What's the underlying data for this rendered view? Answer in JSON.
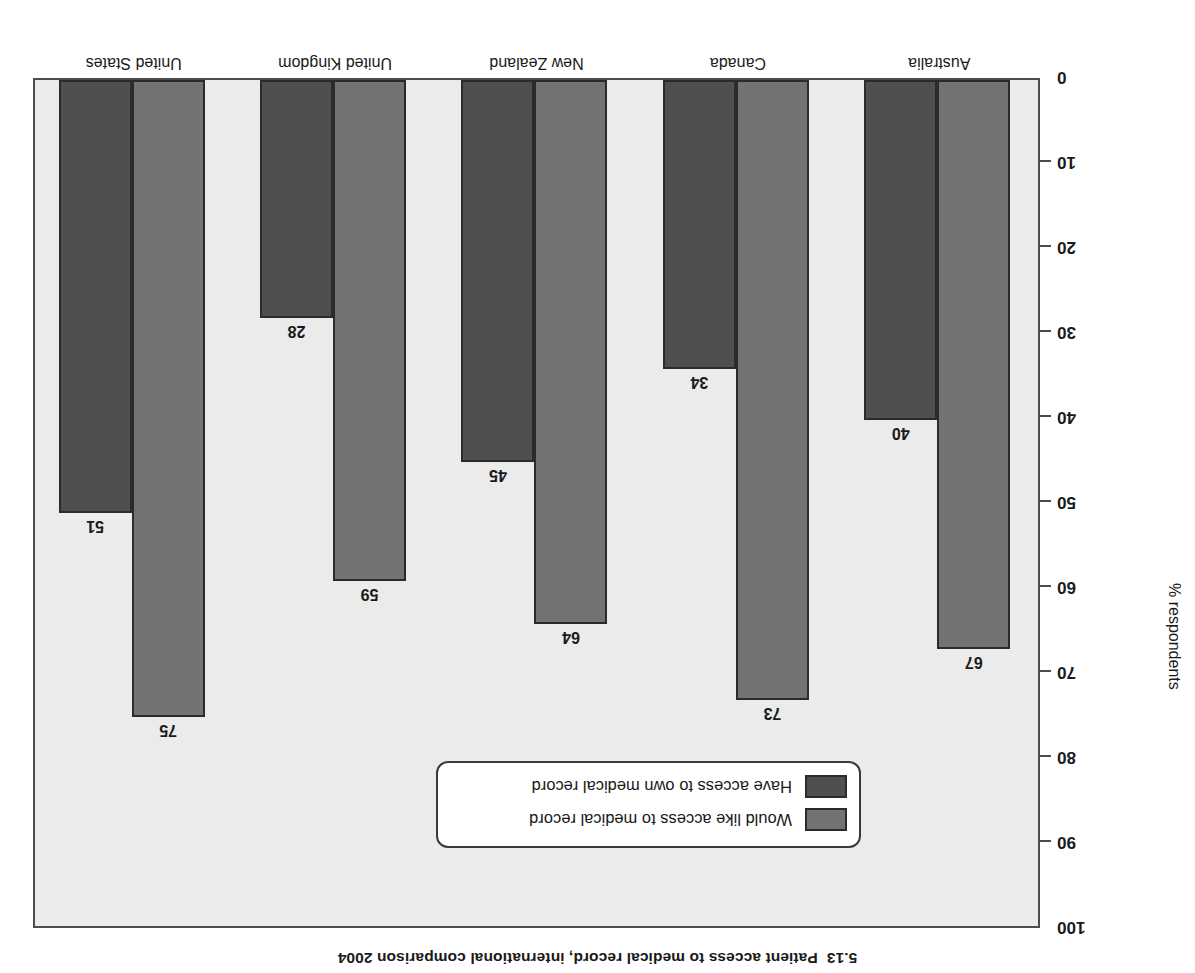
{
  "figure": {
    "number": "5.13",
    "title": "Patient access to medical record, international comparison 2004",
    "orientation_note": "rotated-180"
  },
  "chart_data": {
    "type": "bar",
    "title": "Patient access to medical record, international comparison 2004",
    "xlabel": "",
    "ylabel": "% respondents",
    "ylim": [
      0,
      100
    ],
    "yticks": [
      "0",
      "10",
      "20",
      "30",
      "40",
      "50",
      "60",
      "70",
      "80",
      "90",
      "100"
    ],
    "ytick_values": [
      0,
      10,
      20,
      30,
      40,
      50,
      60,
      70,
      80,
      90,
      100
    ],
    "grid": false,
    "legend_position": "lower-left",
    "categories": [
      "Australia",
      "Canada",
      "New Zealand",
      "United Kingdom",
      "United States"
    ],
    "series": [
      {
        "name": "Would like access to medical record",
        "color": "#737373",
        "values": [
          67,
          73,
          64,
          59,
          75
        ]
      },
      {
        "name": "Have access to own medical record",
        "color": "#4f4f4f",
        "values": [
          40,
          34,
          45,
          28,
          51
        ]
      }
    ]
  },
  "axis": {
    "y_title": "% respondents"
  },
  "legend": {
    "entries": [
      {
        "label": "Would like access to medical record",
        "color": "#737373"
      },
      {
        "label": "Have access to own medical record",
        "color": "#4f4f4f"
      }
    ]
  },
  "colors": {
    "plot_background": "#ebebeb",
    "page_background": "#ffffff",
    "axis_line": "#4d4d4d",
    "bar_outline": "#2b2b2b",
    "text": "#1a1a1a"
  }
}
